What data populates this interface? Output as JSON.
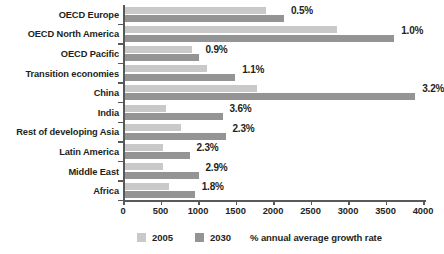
{
  "chart_data": {
    "type": "bar",
    "orientation": "horizontal",
    "title": "",
    "subtitle": "",
    "xlabel": "",
    "ylabel": "",
    "xlim": [
      0,
      4000
    ],
    "xticks": [
      0,
      500,
      1000,
      1500,
      2000,
      2500,
      3000,
      3500,
      4000
    ],
    "xtick_labels": [
      "0",
      "500",
      "1000",
      "1500",
      "2000",
      "2500",
      "3000",
      "3500",
      "4000"
    ],
    "grid": false,
    "legend_position": "bottom",
    "categories": [
      "OECD Europe",
      "OECD North America",
      "OECD Pacific",
      "Transition economies",
      "China",
      "India",
      "Rest of developing Asia",
      "Latin America",
      "Middle East",
      "Africa"
    ],
    "series": [
      {
        "name": "2005",
        "color": "#c9c9c9",
        "values": [
          1880,
          2820,
          890,
          1090,
          1760,
          540,
          740,
          500,
          510,
          590
        ]
      },
      {
        "name": "2030",
        "color": "#949494",
        "values": [
          2120,
          3590,
          980,
          1470,
          3870,
          1300,
          1340,
          860,
          980,
          930
        ]
      }
    ],
    "annotations": {
      "label": "% annual average growth rate",
      "values": [
        "0.5%",
        "1.0%",
        "0.9%",
        "1.1%",
        "3.2%",
        "3.6%",
        "2.3%",
        "2.3%",
        "2.9%",
        "1.8%"
      ]
    }
  },
  "legend": {
    "items": [
      {
        "label": "2005",
        "color": "#c9c9c9"
      },
      {
        "label": "2030",
        "color": "#949494"
      }
    ],
    "note": "% annual average growth rate"
  },
  "colors": {
    "series_2005": "#c9c9c9",
    "series_2030": "#949494",
    "axis": "#58595b",
    "text": "#231f20",
    "background": "#ffffff"
  }
}
